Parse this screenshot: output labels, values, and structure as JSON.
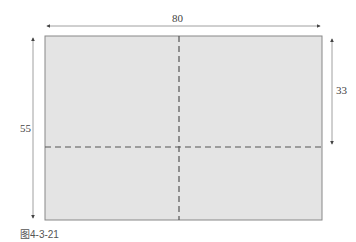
{
  "diagram": {
    "dimensions": {
      "width": "80",
      "right_height": "33",
      "left_height": "55"
    },
    "caption": "图4-3-21",
    "colors": {
      "fill": "#e4e4e4",
      "stroke": "#888888",
      "dash": "#555555"
    }
  }
}
